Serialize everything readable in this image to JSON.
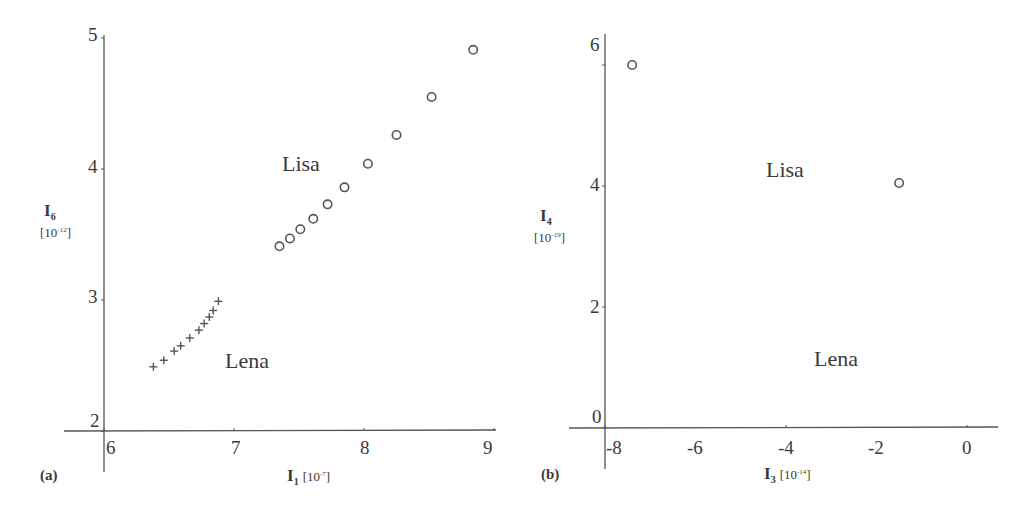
{
  "chart_data": [
    {
      "panel": "(a)",
      "type": "scatter",
      "xlabel": "I1 [10^-7]",
      "ylabel": "I6 [10^-12]",
      "xlim": [
        5.85,
        9.0
      ],
      "ylim": [
        2,
        5
      ],
      "xticks": [
        "6",
        "7",
        "8",
        "9"
      ],
      "yticks": [
        "2",
        "3",
        "4",
        "5"
      ],
      "grid": false,
      "legend": "none (inline annotations)",
      "annotations": [
        {
          "text": "Lisa",
          "x": 7.4,
          "y": 4.05
        },
        {
          "text": "Lena",
          "x": 7.0,
          "y": 2.5
        }
      ],
      "series": [
        {
          "name": "Lisa",
          "marker": "circle",
          "x": [
            7.35,
            7.43,
            7.51,
            7.61,
            7.72,
            7.85,
            8.03,
            8.25,
            8.52,
            8.84
          ],
          "y": [
            3.41,
            3.47,
            3.54,
            3.62,
            3.73,
            3.86,
            4.04,
            4.26,
            4.55,
            4.91
          ]
        },
        {
          "name": "Lena",
          "marker": "plus",
          "x": [
            6.38,
            6.46,
            6.54,
            6.59,
            6.66,
            6.73,
            6.77,
            6.81,
            6.84,
            6.88
          ],
          "y": [
            2.49,
            2.54,
            2.61,
            2.65,
            2.71,
            2.77,
            2.82,
            2.87,
            2.92,
            2.99
          ]
        }
      ]
    },
    {
      "panel": "(b)",
      "type": "scatter",
      "xlabel": "I3 [10^-14]",
      "ylabel": "I4 [10^-19]",
      "xlim": [
        -8.9,
        0.5
      ],
      "ylim": [
        0,
        6.3
      ],
      "xticks": [
        "-8",
        "-6",
        "-4",
        "-2",
        "0"
      ],
      "yticks": [
        "0",
        "2",
        "4",
        "6"
      ],
      "grid": false,
      "legend": "none (inline annotations)",
      "annotations": [
        {
          "text": "Lisa",
          "x": -4.5,
          "y": 4.2
        },
        {
          "text": "Lena",
          "x": -3.4,
          "y": 1.1
        }
      ],
      "series": [
        {
          "name": "Lisa",
          "marker": "circle",
          "x": [
            -7.7,
            -4.75,
            -2.85,
            -1.6,
            -0.72,
            -0.22,
            -0.14,
            0.02,
            0.07,
            0.12,
            0.15
          ],
          "y": [
            6.0,
            4.05,
            2.55,
            1.55,
            0.87,
            0.47,
            0.3,
            0.25,
            0.2,
            0.17,
            0.15
          ]
        },
        {
          "name": "Lena",
          "marker": "plus",
          "x": [
            -2.05,
            -1.62,
            -1.23,
            -0.85,
            -0.52,
            -0.25,
            0.1,
            0.22,
            0.38,
            0.5
          ],
          "y": [
            1.3,
            1.08,
            0.92,
            0.73,
            0.58,
            0.42,
            0.25,
            0.18,
            0.1,
            0.05
          ]
        }
      ]
    }
  ],
  "panels": {
    "a": {
      "tag": "(a)",
      "ylabel_main": "I",
      "ylabel_sub": "6",
      "ylabel_unit_base": "[10",
      "ylabel_unit_exp": "-12",
      "ylabel_unit_close": "]",
      "xlabel_main": "I",
      "xlabel_sub": "1",
      "xlabel_unit_base": "[10",
      "xlabel_unit_exp": "-7",
      "xlabel_unit_close": "]",
      "xticks": [
        "6",
        "7",
        "8",
        "9"
      ],
      "yticks": [
        "2",
        "3",
        "4",
        "5"
      ],
      "annot_lisa": "Lisa",
      "annot_lena": "Lena"
    },
    "b": {
      "tag": "(b)",
      "ylabel_main": "I",
      "ylabel_sub": "4",
      "ylabel_unit_base": "[10",
      "ylabel_unit_exp": "-19",
      "ylabel_unit_close": "]",
      "xlabel_main": "I",
      "xlabel_sub": "3",
      "xlabel_unit_base": "[10",
      "xlabel_unit_exp": "-14",
      "xlabel_unit_close": "]",
      "xticks": [
        "-8",
        "-6",
        "-4",
        "-2",
        "0"
      ],
      "yticks": [
        "0",
        "2",
        "4",
        "6"
      ],
      "annot_lisa": "Lisa",
      "annot_lena": "Lena"
    }
  },
  "colors": {
    "axis": "#555555",
    "marker": "#555555",
    "text": "#3a3a3a"
  }
}
